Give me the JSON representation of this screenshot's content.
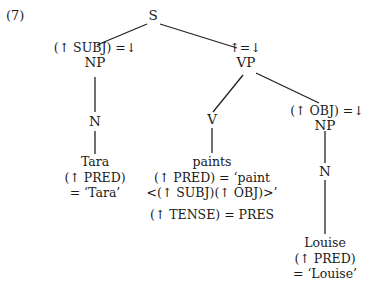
{
  "example_number": "(7)",
  "tree": {
    "root": {
      "label": "S"
    },
    "subj_np": {
      "annotation": "(↑ SUBJ) =↓",
      "label": "NP"
    },
    "subj_n": {
      "label": "N"
    },
    "subj_word": {
      "word": "Tara",
      "eq1": "(↑ PRED)",
      "eq2": "= ‘Tara’"
    },
    "vp": {
      "annotation": "↑=↓",
      "label": "VP"
    },
    "v": {
      "label": "V"
    },
    "verb_word": {
      "word": "paints",
      "eq1": "(↑ PRED) = ‘paint",
      "eq2": "<(↑ SUBJ)(↑ OBJ)>’",
      "eq3": "(↑ TENSE) = PRES"
    },
    "obj_np": {
      "annotation": "(↑ OBJ) =↓",
      "label": "NP"
    },
    "obj_n": {
      "label": "N"
    },
    "obj_word": {
      "word": "Louise",
      "eq1": "(↑ PRED)",
      "eq2": "= ‘Louise’"
    }
  }
}
